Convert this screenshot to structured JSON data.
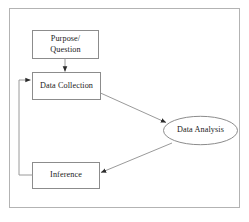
{
  "diagram": {
    "type": "flowchart",
    "border_color": "#b3b3b3",
    "shape_stroke_color": "#8c8c8c",
    "arrow_color": "#9a9a9a",
    "arrowhead_color": "#2b2b2b",
    "background_color": "#ffffff",
    "text_color": "#1a1a1a",
    "nodes": [
      {
        "id": "purpose",
        "label": "Purpose/\nQuestion",
        "shape": "rectangle",
        "x": 32,
        "y": 30,
        "width": 67,
        "height": 29
      },
      {
        "id": "data_collection",
        "label": "Data Collection",
        "shape": "rectangle",
        "x": 32,
        "y": 72,
        "width": 69,
        "height": 28
      },
      {
        "id": "inference",
        "label": "Inference",
        "shape": "rectangle",
        "x": 32,
        "y": 162,
        "width": 68,
        "height": 27
      },
      {
        "id": "data_analysis",
        "label": "Data Analysis",
        "shape": "ellipse",
        "x": 163,
        "y": 116,
        "width": 75,
        "height": 29
      }
    ],
    "edges": [
      {
        "id": "purpose-to-data-collection",
        "from": "purpose",
        "to": "data_collection",
        "style": "straight-vertical",
        "arrowhead": "end"
      },
      {
        "id": "data-collection-to-data-analysis",
        "from": "data_collection",
        "to": "data_analysis",
        "style": "straight-diagonal",
        "arrowhead": "end"
      },
      {
        "id": "data-analysis-to-inference",
        "from": "data_analysis",
        "to": "inference",
        "style": "straight-diagonal",
        "arrowhead": "end"
      },
      {
        "id": "inference-to-data-collection-feedback",
        "from": "inference",
        "to": "data_collection",
        "style": "orthogonal-loop-left",
        "arrowhead": "end"
      }
    ]
  }
}
